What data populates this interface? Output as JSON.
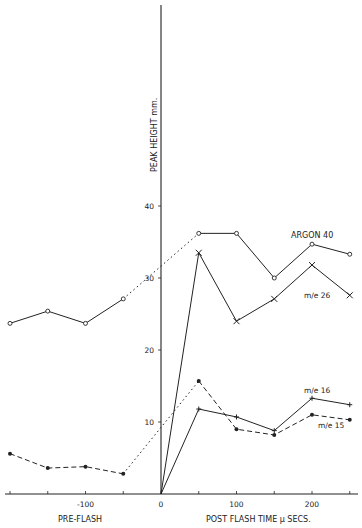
{
  "chart_data": {
    "type": "line",
    "title": "",
    "xlabel_left": "PRE-FLASH",
    "xlabel_right": "POST FLASH TIME μ SECS.",
    "ylabel": "PEAK HEIGHT mm.",
    "xlim": [
      -200,
      250
    ],
    "ylim": [
      0,
      65
    ],
    "x_ticks": [
      -100,
      0,
      100,
      200
    ],
    "y_ticks": [
      10,
      20,
      30,
      40
    ],
    "grid": false,
    "series": [
      {
        "name": "ARGON 40",
        "marker": "open-circle",
        "pre_flash": {
          "x": [
            -200,
            -150,
            -100,
            -50
          ],
          "y": [
            23.7,
            25.4,
            23.7,
            27.1
          ]
        },
        "bridge": {
          "x": [
            -50,
            50
          ],
          "y": [
            27.1,
            36.2
          ],
          "style": "dotted"
        },
        "post_flash": {
          "x": [
            50,
            100,
            150,
            200,
            250
          ],
          "y": [
            36.2,
            36.2,
            30.0,
            34.7,
            33.3
          ]
        }
      },
      {
        "name": "m/e 26",
        "marker": "x",
        "post_flash": {
          "x": [
            0,
            50,
            100,
            150,
            200,
            250
          ],
          "y": [
            0,
            33.5,
            24.0,
            27.1,
            31.8,
            27.6
          ]
        }
      },
      {
        "name": "m/e 16",
        "marker": "plus",
        "post_flash": {
          "x": [
            0,
            50,
            100,
            150,
            200,
            250
          ],
          "y": [
            0,
            11.8,
            10.7,
            8.8,
            13.3,
            12.4
          ]
        }
      },
      {
        "name": "m/e 15",
        "marker": "filled-circle",
        "line_style": "dashed",
        "pre_flash": {
          "x": [
            -200,
            -150,
            -100,
            -50
          ],
          "y": [
            5.6,
            3.6,
            3.8,
            2.8
          ]
        },
        "bridge": {
          "x": [
            -50,
            50
          ],
          "y": [
            2.8,
            15.7
          ],
          "style": "dotted"
        },
        "post_flash": {
          "x": [
            50,
            100,
            150,
            200,
            250
          ],
          "y": [
            15.7,
            9.0,
            8.2,
            11.0,
            10.3
          ]
        }
      }
    ],
    "annotations": [
      "ARGON 40",
      "m/e 26",
      "m/e 16",
      "m/e 15"
    ]
  }
}
